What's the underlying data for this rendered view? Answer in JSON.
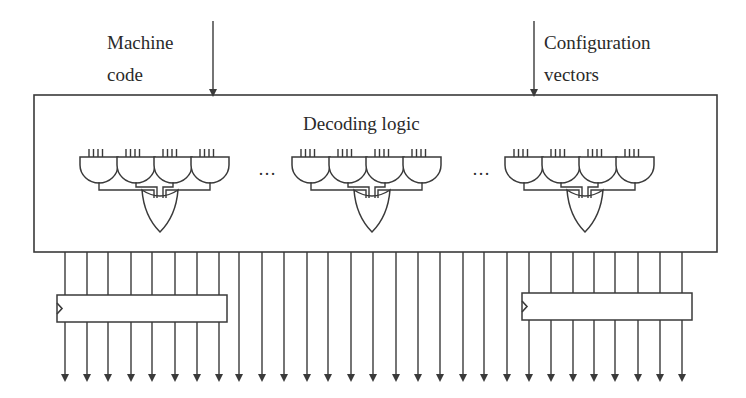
{
  "diagram": {
    "inputs": [
      {
        "label_line1": "Machine",
        "label_line2": "code",
        "arrow_x": 213
      },
      {
        "label_line1": "Configuration",
        "label_line2": "vectors",
        "arrow_x": 534
      }
    ],
    "decoder": {
      "title": "Decoding logic",
      "gate_groups": 3,
      "and_gates_per_group": 4,
      "inputs_per_and_gate": 4,
      "separator": "…"
    },
    "registers": [
      {
        "name": "left-register",
        "x": 57,
        "width": 170,
        "clocked": true
      },
      {
        "name": "right-register",
        "x": 522,
        "width": 170,
        "clocked": true
      }
    ],
    "output_lines_x": [
      65,
      87,
      108,
      131,
      152,
      175,
      197,
      219,
      239,
      262,
      284,
      307,
      328,
      351,
      373,
      396,
      418,
      440,
      463,
      484,
      507,
      529,
      551,
      573,
      594,
      615,
      638,
      660,
      682
    ],
    "colors": {
      "line": "#3a3a3a",
      "text": "#2a2a2a",
      "background": "#ffffff"
    }
  }
}
